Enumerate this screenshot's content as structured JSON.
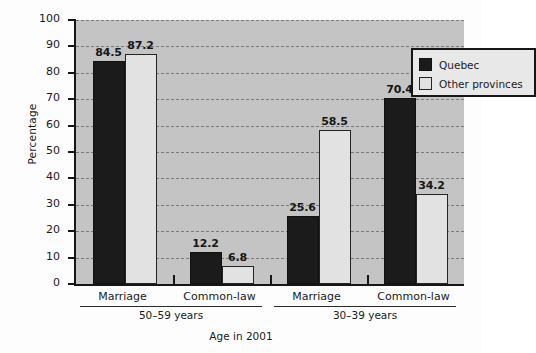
{
  "chart_data": {
    "type": "bar",
    "title": "",
    "xlabel": "Age in 2001",
    "ylabel": "Percentage",
    "ylim": [
      0,
      100
    ],
    "ytick_step": 10,
    "yticks": [
      "0",
      "10",
      "20",
      "30",
      "40",
      "50",
      "60",
      "70",
      "80",
      "90",
      "100"
    ],
    "grid": true,
    "legend_position": "upper right",
    "categories": [
      "Marriage",
      "Common-law",
      "Marriage",
      "Common-law"
    ],
    "group_spans": [
      {
        "label": "50–59 years",
        "categories": [
          "Marriage",
          "Common-law"
        ]
      },
      {
        "label": "30–39 years",
        "categories": [
          "Marriage",
          "Common-law"
        ]
      }
    ],
    "series": [
      {
        "name": "Quebec",
        "color": "#1b1b1b",
        "values": [
          84.5,
          12.2,
          25.6,
          70.4
        ]
      },
      {
        "name": "Other provinces",
        "color": "#e2e2e2",
        "values": [
          87.2,
          6.8,
          58.5,
          34.2
        ]
      }
    ],
    "data_labels": [
      "84.5",
      "87.2",
      "12.2",
      "6.8",
      "25.6",
      "58.5",
      "70.4",
      "34.2"
    ],
    "plot_background": "#c4c4c4",
    "gridline_color": "#7b7b7b",
    "axis_color": "#161616"
  },
  "legend": {
    "items": [
      {
        "label": "Quebec",
        "swatch": "quebec"
      },
      {
        "label": "Other provinces",
        "swatch": "other"
      }
    ]
  },
  "axis": {
    "y_title": "Percentage",
    "x_title": "Age in 2001"
  }
}
